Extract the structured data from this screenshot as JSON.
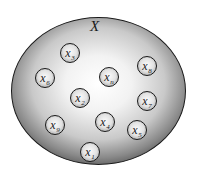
{
  "diagram": {
    "type": "set-membership",
    "set": {
      "label": "X",
      "shape": "ellipse",
      "fill": "#d0d0d0",
      "stroke": "#1a1a1a"
    },
    "elements": [
      {
        "base": "x",
        "sub": "3",
        "cx": 70,
        "cy": 53
      },
      {
        "base": "x",
        "sub": "8",
        "cx": 147,
        "cy": 66
      },
      {
        "base": "x",
        "sub": "6",
        "cx": 45,
        "cy": 78
      },
      {
        "base": "x",
        "sub": "n",
        "cx": 109,
        "cy": 77
      },
      {
        "base": "x",
        "sub": "2",
        "cx": 80,
        "cy": 98
      },
      {
        "base": "x",
        "sub": "7",
        "cx": 147,
        "cy": 101
      },
      {
        "base": "x",
        "sub": "9",
        "cx": 55,
        "cy": 125
      },
      {
        "base": "x",
        "sub": "4",
        "cx": 105,
        "cy": 122
      },
      {
        "base": "x",
        "sub": "5",
        "cx": 137,
        "cy": 130
      },
      {
        "base": "x",
        "sub": "1",
        "cx": 90,
        "cy": 152
      }
    ]
  }
}
